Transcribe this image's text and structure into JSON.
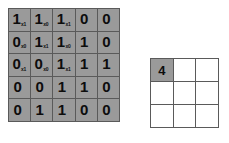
{
  "diagram": {
    "type": "convolution-illustration"
  },
  "input_matrix": {
    "name": "input-feature-map",
    "rows": 5,
    "cols": 5,
    "cell_color": "#9a9a9a",
    "border_color": "#5a5a5a",
    "values": [
      [
        "1",
        "1",
        "1",
        "0",
        "0"
      ],
      [
        "0",
        "1",
        "1",
        "1",
        "0"
      ],
      [
        "0",
        "0",
        "1",
        "1",
        "1"
      ],
      [
        "0",
        "0",
        "1",
        "1",
        "0"
      ],
      [
        "0",
        "1",
        "1",
        "0",
        "0"
      ]
    ],
    "kernel_overlay": {
      "origin_row": 0,
      "origin_col": 0,
      "rows": 3,
      "cols": 3,
      "subscripts": [
        [
          "x1",
          "x0",
          "x1"
        ],
        [
          "x0",
          "x1",
          "x0"
        ],
        [
          "x1",
          "x0",
          "x1"
        ]
      ]
    }
  },
  "output_matrix": {
    "name": "output-feature-map",
    "rows": 3,
    "cols": 3,
    "filled_color": "#9a9a9a",
    "empty_color": "#ffffff",
    "border_color": "#5a5a5a",
    "values": [
      [
        "4",
        "",
        ""
      ],
      [
        "",
        "",
        ""
      ],
      [
        "",
        "",
        ""
      ]
    ]
  },
  "chart_data": {
    "type": "heatmap",
    "xlabel": "",
    "ylabel": "",
    "grids": [
      {
        "name": "input",
        "rows": 5,
        "cols": 5,
        "values": [
          [
            1,
            1,
            1,
            0,
            0
          ],
          [
            0,
            1,
            1,
            1,
            0
          ],
          [
            0,
            0,
            1,
            1,
            1
          ],
          [
            0,
            0,
            1,
            1,
            0
          ],
          [
            0,
            1,
            1,
            0,
            0
          ]
        ]
      },
      {
        "name": "kernel",
        "rows": 3,
        "cols": 3,
        "values": [
          [
            1,
            0,
            1
          ],
          [
            0,
            1,
            0
          ],
          [
            1,
            0,
            1
          ]
        ]
      },
      {
        "name": "output",
        "rows": 3,
        "cols": 3,
        "values": [
          [
            4,
            null,
            null
          ],
          [
            null,
            null,
            null
          ],
          [
            null,
            null,
            null
          ]
        ]
      }
    ]
  }
}
